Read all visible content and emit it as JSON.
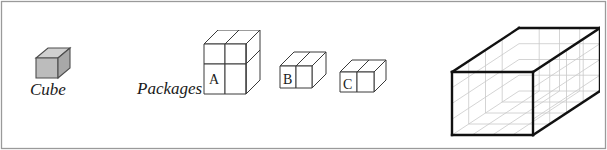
{
  "figure": {
    "background_color": "#ffffff",
    "frame_color": "#9a9a9a",
    "width": 607,
    "height": 150
  },
  "labels": {
    "cube": "Cube",
    "packages": "Packages",
    "package_a": "A",
    "package_b": "B",
    "package_c": "C"
  },
  "unit_cube": {
    "name": "Cube",
    "fill_top": "#cfcfcf",
    "fill_front": "#b9b9b9",
    "fill_side": "#a5a5a5",
    "stroke": "#4a4a4a",
    "dimensions": "1 x 1 x 1"
  },
  "packages": [
    {
      "id": "A",
      "label": "A",
      "dimensions": "2 x 2 x 2",
      "width": 2,
      "height": 2,
      "depth": 2,
      "unit_count": 8,
      "fill": "#ffffff",
      "stroke": "#3a3a3a"
    },
    {
      "id": "B",
      "label": "B",
      "dimensions": "1 x 1 x 2",
      "width": 1,
      "height": 1,
      "depth": 2,
      "unit_count": 2,
      "fill": "#ffffff",
      "stroke": "#3a3a3a"
    },
    {
      "id": "C",
      "label": "C",
      "dimensions": "2 x 1 x 1",
      "width": 2,
      "height": 1,
      "depth": 1,
      "unit_count": 2,
      "fill": "#ffffff",
      "stroke": "#3a3a3a"
    }
  ],
  "container": {
    "name": "Open box",
    "width_units": 4,
    "height_units": 4,
    "depth_units": 4,
    "capacity_units": 64,
    "edge_color": "#111111",
    "grid_color": "#c8c8c8",
    "fill": "#ffffff"
  }
}
